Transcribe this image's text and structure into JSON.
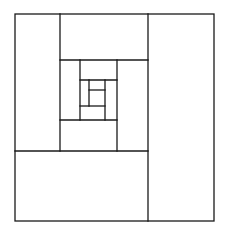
{
  "diagram": {
    "type": "nested-rectangle-spiral",
    "stroke_color": "#1a1a1a",
    "background": "#ffffff",
    "outer": {
      "x": 15,
      "y": 14,
      "w": 199,
      "h": 207
    },
    "segments": [
      {
        "x1": 148,
        "y1": 14,
        "x2": 148,
        "y2": 221
      },
      {
        "x1": 15,
        "y1": 151,
        "x2": 148,
        "y2": 151
      },
      {
        "x1": 60,
        "y1": 14,
        "x2": 60,
        "y2": 151
      },
      {
        "x1": 60,
        "y1": 60,
        "x2": 148,
        "y2": 60
      },
      {
        "x1": 117,
        "y1": 60,
        "x2": 117,
        "y2": 151
      },
      {
        "x1": 60,
        "y1": 120,
        "x2": 117,
        "y2": 120
      },
      {
        "x1": 80,
        "y1": 60,
        "x2": 80,
        "y2": 120
      },
      {
        "x1": 80,
        "y1": 80,
        "x2": 117,
        "y2": 80
      },
      {
        "x1": 105,
        "y1": 80,
        "x2": 105,
        "y2": 120
      },
      {
        "x1": 80,
        "y1": 106,
        "x2": 105,
        "y2": 106
      },
      {
        "x1": 89,
        "y1": 80,
        "x2": 89,
        "y2": 106
      },
      {
        "x1": 89,
        "y1": 90,
        "x2": 105,
        "y2": 90
      }
    ]
  }
}
